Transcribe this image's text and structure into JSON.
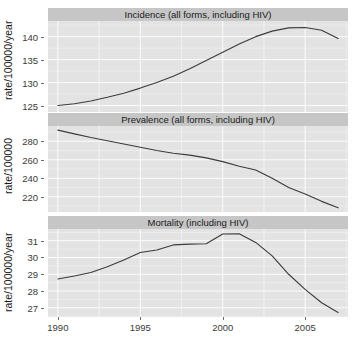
{
  "figure": {
    "type": "multi-panel-line-chart",
    "width": 354,
    "height": 340,
    "panel_bg": "#e3e3e3",
    "strip_bg": "#c6c6c6",
    "grid_color": "#ffffff",
    "line_color": "#3b3b3b",
    "text_color": "#1a1a1a"
  },
  "axes": {
    "x_label": "",
    "x_ticks": [
      "1990",
      "1995",
      "2000",
      "2005"
    ],
    "x_tick_values": [
      1990,
      1995,
      2000,
      2005
    ],
    "x_range": [
      1989.4,
      2007.6
    ]
  },
  "panels": [
    {
      "strip_label": "Incidence (all forms, including HIV)",
      "y_label": "rate/100000/year",
      "y_ticks": [
        "125",
        "130",
        "135",
        "140"
      ],
      "y_tick_values": [
        125,
        130,
        135,
        140
      ],
      "y_range": [
        123.6,
        143.4
      ]
    },
    {
      "strip_label": "Prevalence (all forms, including HIV)",
      "y_label": "rate/100000",
      "y_ticks": [
        "220",
        "240",
        "260",
        "280"
      ],
      "y_tick_values": [
        220,
        240,
        260,
        280
      ],
      "y_range": [
        203.5,
        296.5
      ]
    },
    {
      "strip_label": "Mortality (including HIV)",
      "y_label": "rate/100000/year",
      "y_ticks": [
        "27",
        "28",
        "29",
        "30",
        "31"
      ],
      "y_tick_values": [
        27,
        28,
        29,
        30,
        31
      ],
      "y_range": [
        26.45,
        31.7
      ]
    }
  ],
  "chart_data": [
    {
      "type": "line",
      "title": "Incidence (all forms, including HIV)",
      "xlabel": "",
      "ylabel": "rate/100000/year",
      "xlim": [
        1989.4,
        2007.6
      ],
      "ylim": [
        123.6,
        143.4
      ],
      "grid": true,
      "legend": "none",
      "x": [
        1990,
        1991,
        1992,
        1993,
        1994,
        1995,
        1996,
        1997,
        1998,
        1999,
        2000,
        2001,
        2002,
        2003,
        2004,
        2005,
        2006,
        2007
      ],
      "values": [
        125.0,
        125.4,
        126.0,
        126.8,
        127.7,
        128.8,
        130.0,
        131.4,
        133.0,
        134.8,
        136.6,
        138.4,
        140.0,
        141.2,
        141.9,
        142.0,
        141.4,
        139.6
      ]
    },
    {
      "type": "line",
      "title": "Prevalence (all forms, including HIV)",
      "xlabel": "",
      "ylabel": "rate/100000",
      "xlim": [
        1989.4,
        2007.6
      ],
      "ylim": [
        203.5,
        296.5
      ],
      "grid": true,
      "legend": "none",
      "x": [
        1990,
        1991,
        1992,
        1993,
        1994,
        1995,
        1996,
        1997,
        1998,
        1999,
        2000,
        2001,
        2002,
        2003,
        2004,
        2005,
        2006,
        2007
      ],
      "values": [
        292.0,
        288.0,
        284.0,
        280.5,
        277.0,
        273.5,
        270.0,
        267.0,
        265.0,
        262.0,
        258.0,
        253.0,
        249.0,
        240.0,
        230.0,
        223.0,
        215.0,
        208.0
      ]
    },
    {
      "type": "line",
      "title": "Mortality (including HIV)",
      "xlabel": "",
      "ylabel": "rate/100000/year",
      "xlim": [
        1989.4,
        2007.6
      ],
      "ylim": [
        26.45,
        31.7
      ],
      "grid": true,
      "legend": "none",
      "x": [
        1990,
        1991,
        1992,
        1993,
        1994,
        1995,
        1996,
        1997,
        1998,
        1999,
        2000,
        2001,
        2002,
        2003,
        2004,
        2005,
        2006,
        2007
      ],
      "values": [
        28.72,
        28.9,
        29.1,
        29.45,
        29.85,
        30.3,
        30.45,
        30.75,
        30.8,
        30.82,
        31.4,
        31.42,
        30.9,
        30.1,
        29.0,
        28.1,
        27.3,
        26.72
      ]
    }
  ]
}
